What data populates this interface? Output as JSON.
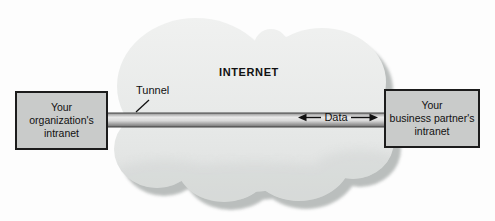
{
  "diagram": {
    "title_implied": "VPN tunnel between two intranets across the Internet",
    "labels": {
      "internet": "INTERNET",
      "tunnel": "Tunnel",
      "data": "Data"
    },
    "boxes": {
      "left": "Your\norganization's\nintranet",
      "right": "Your\nbusiness partner's\nintranet"
    },
    "colors": {
      "background": "#fdfdfd",
      "cloud_light": "#f0f1f0",
      "cloud_dark": "#dddfde",
      "cloud_shadow": "#b7bbba",
      "cloud_inner_shade": "#cfd2d1",
      "box_fill": "#c9cbca",
      "box_border": "#1c1c1c",
      "pipe_edge": "#434343",
      "pipe_dark_top": "#8f8f8f",
      "pipe_highlight": "#eaeaea",
      "pipe_dark_bottom": "#6f6f6f",
      "text": "#111111",
      "arrow": "#111111"
    }
  }
}
